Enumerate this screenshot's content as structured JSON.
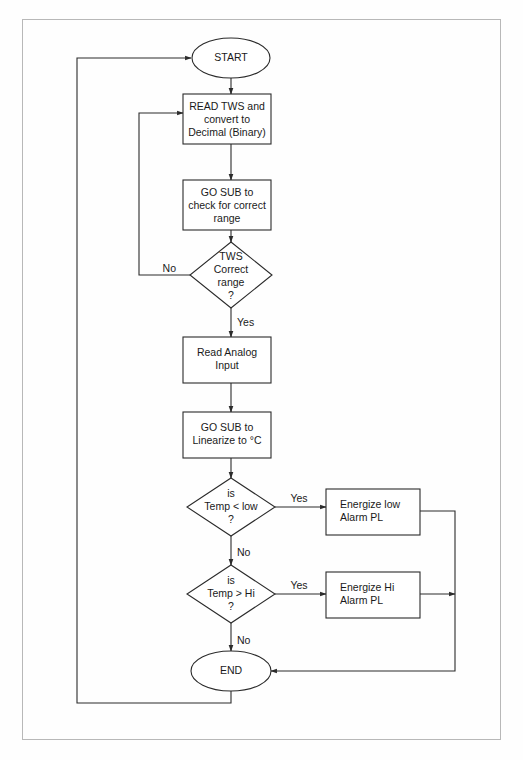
{
  "diagram": {
    "type": "flowchart",
    "background_color": "#fefefe",
    "line_color": "#2b2b2b",
    "border_color": "#b8b8b8",
    "nodes": [
      {
        "id": "start",
        "shape": "terminator",
        "lines": [
          "START"
        ],
        "cx": 231,
        "cy": 58,
        "rx": 39,
        "ry": 20
      },
      {
        "id": "read-tws",
        "shape": "process",
        "lines": [
          "READ TWS and",
          "convert to",
          "Decimal (Binary)"
        ],
        "x": 183,
        "y": 94,
        "w": 88,
        "h": 50
      },
      {
        "id": "gosub-range",
        "shape": "process",
        "lines": [
          "GO SUB to",
          "check for correct",
          "range"
        ],
        "x": 183,
        "y": 180,
        "w": 88,
        "h": 50
      },
      {
        "id": "tws-correct",
        "shape": "decision",
        "lines": [
          "TWS",
          "Correct",
          "range",
          "?"
        ],
        "cx": 231,
        "cy": 275,
        "hw": 41,
        "hh": 33
      },
      {
        "id": "read-analog",
        "shape": "process",
        "lines": [
          "Read Analog",
          "Input"
        ],
        "x": 183,
        "y": 337,
        "w": 88,
        "h": 46
      },
      {
        "id": "gosub-linearize",
        "shape": "process",
        "lines": [
          "GO SUB to",
          "Linearize to °C"
        ],
        "x": 183,
        "y": 412,
        "w": 88,
        "h": 46
      },
      {
        "id": "temp-low",
        "shape": "decision",
        "lines": [
          "is",
          "Temp < low",
          "?"
        ],
        "cx": 231,
        "cy": 507,
        "hw": 44,
        "hh": 29
      },
      {
        "id": "energize-low",
        "shape": "process",
        "lines": [
          "Energize low",
          "Alarm PL"
        ],
        "x": 326,
        "y": 489,
        "w": 94,
        "h": 46
      },
      {
        "id": "temp-hi",
        "shape": "decision",
        "lines": [
          "is",
          "Temp > Hi",
          "?"
        ],
        "cx": 231,
        "cy": 594,
        "hw": 44,
        "hh": 29
      },
      {
        "id": "energize-hi",
        "shape": "process",
        "lines": [
          "Energize Hi",
          "Alarm PL"
        ],
        "x": 326,
        "y": 572,
        "w": 94,
        "h": 46
      },
      {
        "id": "end",
        "shape": "terminator",
        "lines": [
          "END"
        ],
        "cx": 231,
        "cy": 671,
        "rx": 39,
        "ry": 20
      }
    ],
    "edge_labels": [
      {
        "id": "tws-no",
        "text": "No",
        "x": 162,
        "y": 269
      },
      {
        "id": "tws-yes",
        "text": "Yes",
        "x": 237,
        "y": 323
      },
      {
        "id": "low-yes",
        "text": "Yes",
        "x": 299,
        "y": 499
      },
      {
        "id": "low-no",
        "text": "No",
        "x": 237,
        "y": 553
      },
      {
        "id": "hi-yes",
        "text": "Yes",
        "x": 299,
        "y": 586
      },
      {
        "id": "hi-no",
        "text": "No",
        "x": 237,
        "y": 641
      }
    ],
    "connectors": [
      {
        "id": "start-to-read-tws",
        "from": "start",
        "to": "read-tws"
      },
      {
        "id": "read-tws-to-gosub-range",
        "from": "read-tws",
        "to": "gosub-range"
      },
      {
        "id": "gosub-range-to-tws-correct",
        "from": "gosub-range",
        "to": "tws-correct"
      },
      {
        "id": "tws-no-loop",
        "from": "tws-correct",
        "to": "read-tws",
        "label": "No"
      },
      {
        "id": "tws-yes-to-read-analog",
        "from": "tws-correct",
        "to": "read-analog",
        "label": "Yes"
      },
      {
        "id": "read-analog-to-linearize",
        "from": "read-analog",
        "to": "gosub-linearize"
      },
      {
        "id": "linearize-to-temp-low",
        "from": "gosub-linearize",
        "to": "temp-low"
      },
      {
        "id": "low-yes-to-energize-low",
        "from": "temp-low",
        "to": "energize-low",
        "label": "Yes"
      },
      {
        "id": "low-no-to-temp-hi",
        "from": "temp-low",
        "to": "temp-hi",
        "label": "No"
      },
      {
        "id": "hi-yes-to-energize-hi",
        "from": "temp-hi",
        "to": "energize-hi",
        "label": "Yes"
      },
      {
        "id": "hi-no-to-end",
        "from": "temp-hi",
        "to": "end",
        "label": "No"
      },
      {
        "id": "energize-low-to-end",
        "from": "energize-low",
        "to": "end"
      },
      {
        "id": "energize-hi-to-end",
        "from": "energize-hi",
        "to": "end"
      },
      {
        "id": "end-to-start-loop",
        "from": "end",
        "to": "start"
      }
    ]
  }
}
